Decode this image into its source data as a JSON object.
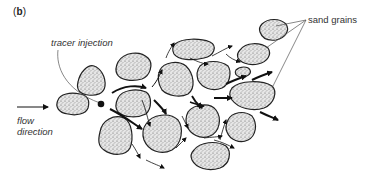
{
  "figure": {
    "panel_label": "b",
    "panel_label_open": "(",
    "panel_label_close": ")",
    "labels": {
      "tracer_injection": "tracer injection",
      "sand_grains": "sand grains",
      "flow_direction_line1": "flow",
      "flow_direction_line2": "direction"
    },
    "colors": {
      "grain_outline": "#222222",
      "grain_fill": "#d9d9d9",
      "arrow": "#111111",
      "leader_line": "#555555",
      "background": "#ffffff"
    },
    "elements": {
      "grains_count": 16,
      "injection_point": "black dot",
      "flow_arrows": "streamlines around grains"
    }
  }
}
